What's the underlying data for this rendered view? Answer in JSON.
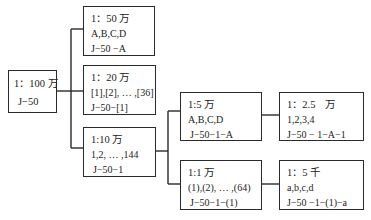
{
  "diagram": {
    "title": "",
    "nodes": [
      {
        "id": "n100w",
        "scale": "1：100 万",
        "sheets": "",
        "code": "J−50"
      },
      {
        "id": "n50w",
        "scale": "1：50 万",
        "sheets": "A,B,C,D",
        "code": "J−50 −A"
      },
      {
        "id": "n20w",
        "scale": "1：20 万",
        "sheets": "[1],[2], … ,[36]",
        "code": "J−50−[1]"
      },
      {
        "id": "n10w",
        "scale": "1:10 万",
        "sheets": "1,2, … ,144",
        "code": "J−50−1"
      },
      {
        "id": "n5w",
        "scale": "1:5 万",
        "sheets": "A,B,C,D",
        "code": "J−50−1−A"
      },
      {
        "id": "n1w",
        "scale": "1:1 万",
        "sheets": "(1),(2), … ,(64)",
        "code": "J−50−1−(1)"
      },
      {
        "id": "n25k",
        "scale": "1：2.5　万",
        "sheets": "1,2,3,4",
        "code": "J−50 − 1−A−1"
      },
      {
        "id": "n5k",
        "scale": "1：5 千",
        "sheets": "a,b,c,d",
        "code": "J−50 −1−(1)−a"
      }
    ],
    "edges": [
      [
        "n100w",
        "n50w"
      ],
      [
        "n100w",
        "n20w"
      ],
      [
        "n100w",
        "n10w"
      ],
      [
        "n10w",
        "n5w"
      ],
      [
        "n10w",
        "n1w"
      ],
      [
        "n5w",
        "n25k"
      ],
      [
        "n1w",
        "n5k"
      ]
    ]
  }
}
